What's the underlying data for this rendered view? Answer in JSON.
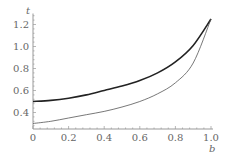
{
  "chart_data": {
    "type": "line",
    "title": "",
    "xlabel": "b",
    "ylabel": "t",
    "xlim": [
      0,
      1.0
    ],
    "ylim": [
      0.25,
      1.3
    ],
    "axis_origin": [
      0,
      0.25
    ],
    "grid": false,
    "legend": null,
    "x_ticks": [
      "0",
      "0.2",
      "0.4",
      "0.6",
      "0.8",
      "1.0"
    ],
    "y_ticks": [
      "0.4",
      "0.6",
      "0.8",
      "1.0",
      "1.2"
    ],
    "x": [
      0,
      0.1,
      0.2,
      0.3,
      0.4,
      0.5,
      0.6,
      0.7,
      0.8,
      0.9,
      1.0
    ],
    "series": [
      {
        "name": "upper curve (thick)",
        "style": "thick",
        "color": "#222222",
        "values": [
          0.5,
          0.51,
          0.53,
          0.56,
          0.6,
          0.64,
          0.69,
          0.76,
          0.86,
          1.01,
          1.25
        ]
      },
      {
        "name": "lower curve (thin)",
        "style": "thin",
        "color": "#555555",
        "values": [
          0.3,
          0.32,
          0.35,
          0.38,
          0.41,
          0.45,
          0.5,
          0.57,
          0.67,
          0.85,
          1.25
        ]
      }
    ]
  },
  "labels": {
    "x_axis": "b",
    "y_axis": "t"
  }
}
